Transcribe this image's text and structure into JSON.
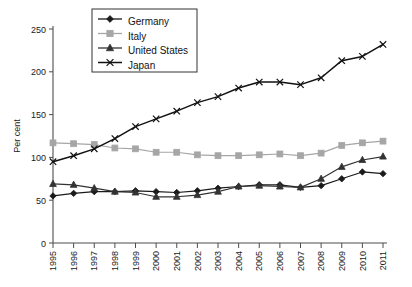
{
  "chart_data": {
    "type": "line",
    "title": "",
    "xlabel": "",
    "ylabel": "Per cent",
    "ylim": [
      0,
      250
    ],
    "yticks": [
      0,
      50,
      100,
      150,
      200,
      250
    ],
    "grid": false,
    "legend_position": "top-left-inside",
    "categories": [
      "1995",
      "1996",
      "1997",
      "1998",
      "1999",
      "2000",
      "2001",
      "2002",
      "2003",
      "2004",
      "2005",
      "2006",
      "2007",
      "2008",
      "2009",
      "2010",
      "2011"
    ],
    "series": [
      {
        "name": "Germany",
        "marker": "diamond",
        "color": "#1a1a1a",
        "values": [
          55,
          58,
          60,
          60,
          61,
          60,
          59,
          61,
          64,
          66,
          68,
          68,
          65,
          67,
          75,
          83,
          81
        ]
      },
      {
        "name": "Italy",
        "marker": "square",
        "color": "#a6a6a6",
        "values": [
          117,
          116,
          115,
          111,
          110,
          106,
          106,
          103,
          102,
          102,
          103,
          104,
          102,
          105,
          114,
          117,
          119
        ]
      },
      {
        "name": "United States",
        "marker": "triangle",
        "color": "#333333",
        "values": [
          69,
          68,
          64,
          60,
          59,
          54,
          54,
          56,
          60,
          66,
          67,
          66,
          65,
          75,
          89,
          97,
          101
        ]
      },
      {
        "name": "Japan",
        "marker": "x",
        "color": "#111111",
        "values": [
          95,
          102,
          110,
          122,
          136,
          145,
          154,
          164,
          171,
          181,
          188,
          188,
          185,
          193,
          213,
          218,
          232
        ]
      }
    ]
  },
  "axes": {
    "y_axis_title": "Per cent",
    "y_tick_labels": [
      "0",
      "50",
      "100",
      "150",
      "200",
      "250"
    ],
    "x_tick_labels": [
      "1995",
      "1996",
      "1997",
      "1998",
      "1999",
      "2000",
      "2001",
      "2002",
      "2003",
      "2004",
      "2005",
      "2006",
      "2007",
      "2008",
      "2009",
      "2010",
      "2011"
    ]
  },
  "legend": {
    "items": [
      {
        "label": "Germany",
        "marker": "diamond",
        "color": "#1a1a1a"
      },
      {
        "label": "Italy",
        "marker": "square",
        "color": "#a6a6a6"
      },
      {
        "label": "United States",
        "marker": "triangle",
        "color": "#333333"
      },
      {
        "label": "Japan",
        "marker": "x",
        "color": "#111111"
      }
    ]
  }
}
